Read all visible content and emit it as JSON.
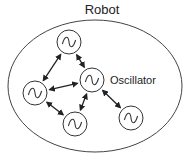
{
  "diagram": {
    "title": "Robot",
    "label": "Oscillator",
    "container": {
      "shape": "ellipse",
      "cx": 95,
      "cy": 86,
      "rx": 87,
      "ry": 66
    },
    "nodes": [
      {
        "id": "top",
        "cx": 69,
        "cy": 42,
        "r": 12,
        "symbol": "sine"
      },
      {
        "id": "center",
        "cx": 92,
        "cy": 80,
        "r": 12,
        "symbol": "sine"
      },
      {
        "id": "left",
        "cx": 35,
        "cy": 93,
        "r": 12,
        "symbol": "sine"
      },
      {
        "id": "bottom",
        "cx": 75,
        "cy": 124,
        "r": 12,
        "symbol": "sine"
      },
      {
        "id": "right",
        "cx": 131,
        "cy": 118,
        "r": 12,
        "symbol": "sine"
      }
    ],
    "edges": [
      {
        "from": "top",
        "to": "left",
        "bidirectional": true
      },
      {
        "from": "top",
        "to": "center",
        "bidirectional": true
      },
      {
        "from": "left",
        "to": "center",
        "bidirectional": true
      },
      {
        "from": "left",
        "to": "bottom",
        "bidirectional": true
      },
      {
        "from": "center",
        "to": "bottom",
        "bidirectional": true
      },
      {
        "from": "center",
        "to": "right",
        "bidirectional": true
      }
    ],
    "colors": {
      "stroke": "#333333",
      "background": "#ffffff"
    }
  }
}
